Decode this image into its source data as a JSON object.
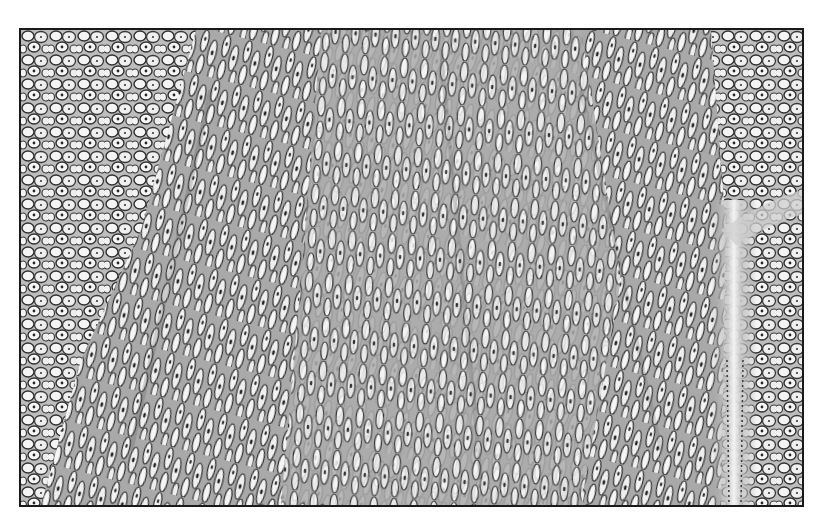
{
  "image": {
    "kind": "histology-micrograph",
    "colorMode": "grayscale",
    "caption": "",
    "regions": [
      {
        "name": "left-polygonal-cells",
        "description": "rounded/polygonal cells with clear cytoplasm"
      },
      {
        "name": "central-spindle-band",
        "description": "elongated spindle cells with oval nuclei in fascicles"
      },
      {
        "name": "right-polygonal-cells",
        "description": "rounded cells with clear cytoplasm"
      },
      {
        "name": "vascular-stromal-streak",
        "description": "pale vertical fibrous/vascular channel near right side"
      }
    ],
    "colors": {
      "border": "#1a1a1a",
      "background": "#ffffff",
      "cellMembrane": "#3a3a3a",
      "cytoplasm": "#f2f2f2",
      "nucleus": "#2a2a2a",
      "stroma": "#b8b8b8"
    }
  }
}
